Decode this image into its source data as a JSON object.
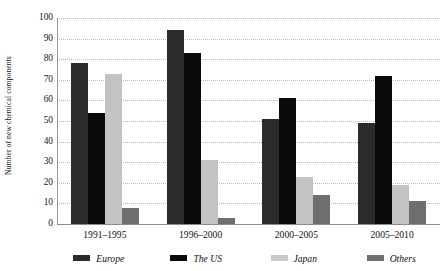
{
  "chart_data": {
    "type": "bar",
    "title": "",
    "xlabel": "",
    "ylabel": "Number of new chemical components",
    "ylim": [
      0,
      100
    ],
    "ytick_step": 10,
    "yticks": [
      100,
      90,
      80,
      70,
      60,
      50,
      40,
      30,
      20,
      10,
      0
    ],
    "grid": true,
    "legend_position": "bottom",
    "categories": [
      "1991–1995",
      "1996–2000",
      "2000–2005",
      "2005–2010"
    ],
    "series": [
      {
        "name": "Europe",
        "color": "#2b2b2b",
        "values": [
          78,
          94,
          51,
          49
        ]
      },
      {
        "name": "The US",
        "color": "#0a0a0a",
        "values": [
          54,
          83,
          61,
          72
        ]
      },
      {
        "name": "Japan",
        "color": "#c3c3c3",
        "values": [
          73,
          31,
          23,
          19
        ]
      },
      {
        "name": "Others",
        "color": "#6f6f6f",
        "values": [
          8,
          3,
          14,
          11
        ]
      }
    ]
  },
  "axis": {
    "y_title": "Number of new chemical components"
  },
  "legend": {
    "items": [
      {
        "label": "Europe"
      },
      {
        "label": "The US"
      },
      {
        "label": "Japan"
      },
      {
        "label": "Others"
      }
    ]
  }
}
